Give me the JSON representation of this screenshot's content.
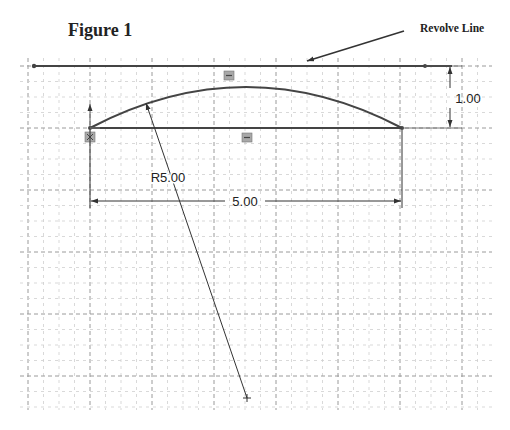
{
  "figure": {
    "title": "Figure 1",
    "callout_label": "Revolve Line"
  },
  "dimensions": {
    "height_label": "1.00",
    "width_label": "5.00",
    "radius_label": "R5.00"
  },
  "colors": {
    "sketch_line": "#333333",
    "grid_major": "#9a9a9a",
    "grid_minor": "#cfcfcf",
    "relation_icon": "#9e9e9e"
  },
  "icons": [
    "horizontal-relation-icon",
    "horizontal-relation-icon",
    "fixed-relation-icon",
    "origin-arrow-icon"
  ]
}
